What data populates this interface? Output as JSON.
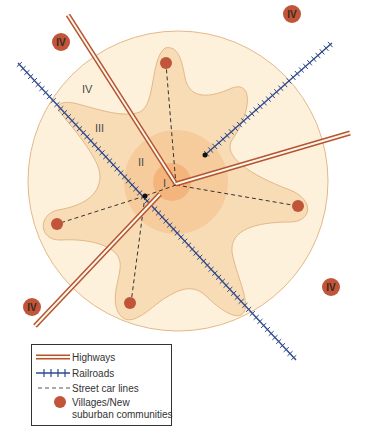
{
  "diagram": {
    "zones": [
      {
        "id": "I",
        "label": "I"
      },
      {
        "id": "II",
        "label": "II"
      },
      {
        "id": "III",
        "label": "III"
      },
      {
        "id": "IV",
        "label": "IV"
      }
    ],
    "outlying_communities": [
      {
        "label": "IV"
      },
      {
        "label": "IV"
      },
      {
        "label": "IV"
      },
      {
        "label": "IV"
      }
    ],
    "colors": {
      "zone_iv_fill": "#fdf1dc",
      "zone_iv_stroke": "#e3b887",
      "zone_iii_fill": "#f8dcb6",
      "zone_ii_fill": "#f6c999",
      "zone_i_fill": "#f4b57c",
      "village": "#c0553a",
      "highway": "#b5542f",
      "railroad": "#2e4a8c",
      "streetcar": "#333333"
    }
  },
  "legend": {
    "items": [
      {
        "symbol": "highway",
        "label": "Highways"
      },
      {
        "symbol": "railroad",
        "label": "Railroads"
      },
      {
        "symbol": "streetcar",
        "label": "Street car lines"
      },
      {
        "symbol": "village",
        "label": "Villages/New",
        "label2": "suburban communities"
      }
    ]
  }
}
